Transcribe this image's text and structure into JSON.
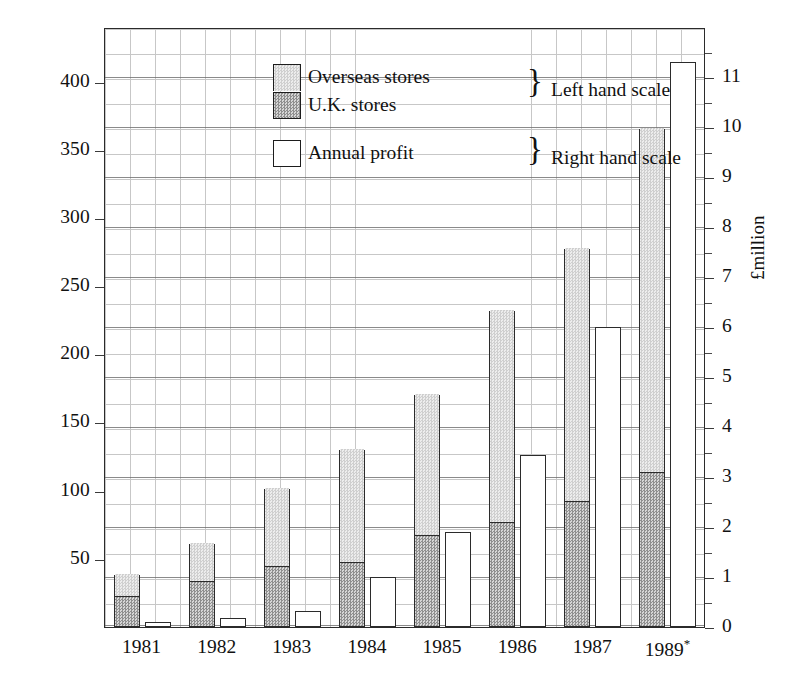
{
  "chart_data": {
    "type": "bar",
    "title": "",
    "subtitle": "",
    "xlabel": "",
    "ylabel_left": "",
    "ylabel_right": "£million",
    "grid": true,
    "legend_position": "inside top-left",
    "categories": [
      "1981",
      "1982",
      "1983",
      "1984",
      "1985",
      "1986",
      "1987",
      "1989*"
    ],
    "left_axis": {
      "ticks": [
        50,
        100,
        150,
        200,
        250,
        300,
        350,
        400
      ],
      "ylim": [
        0,
        440
      ],
      "applies_to": [
        "Overseas stores",
        "U.K. stores"
      ]
    },
    "right_axis": {
      "ticks": [
        0,
        1,
        2,
        3,
        4,
        5,
        6,
        7,
        8,
        9,
        10,
        11
      ],
      "ylim": [
        0,
        12
      ],
      "label": "£million",
      "applies_to": [
        "Annual profit"
      ]
    },
    "series": [
      {
        "name": "U.K. stores",
        "stack": "stores",
        "axis": "left",
        "values": [
          22,
          33,
          44,
          47,
          67,
          76,
          92,
          113
        ]
      },
      {
        "name": "Overseas stores",
        "stack": "stores",
        "axis": "left",
        "values": [
          16,
          28,
          57,
          83,
          103,
          156,
          185,
          252
        ]
      },
      {
        "name": "Annual profit",
        "stack": null,
        "axis": "right",
        "values": [
          0.1,
          0.18,
          0.32,
          1.0,
          1.9,
          3.45,
          6.0,
          11.3
        ]
      }
    ],
    "stacked_totals": [
      38,
      61,
      101,
      130,
      170,
      232,
      277,
      365
    ],
    "annotations": [
      "* 1989 figures",
      "Left hand scale applies to store counts",
      "Right hand scale applies to annual profit"
    ]
  },
  "legend": {
    "rows": [
      {
        "label": "Overseas stores",
        "swatch": "light-dotted-square"
      },
      {
        "label": "U.K. stores",
        "swatch": "dark-checkered-square"
      },
      {
        "label": "Annual profit",
        "swatch": "white-outline-square"
      }
    ],
    "brace_top": "}",
    "brace_bottom": "}",
    "scale_left": "Left hand scale",
    "scale_right": "Right hand scale"
  },
  "axis_labels": {
    "left_ticks": [
      "400",
      "350",
      "300",
      "250",
      "200",
      "150",
      "100",
      "50"
    ],
    "right_ticks": [
      "11",
      "10",
      "9",
      "8",
      "7",
      "6",
      "5",
      "4",
      "3",
      "2",
      "1",
      "0"
    ],
    "x_ticks": [
      "1981",
      "1982",
      "1983",
      "1984",
      "1985",
      "1986",
      "1987",
      "1989"
    ],
    "x_last_marker": "*",
    "unit": "£million"
  }
}
